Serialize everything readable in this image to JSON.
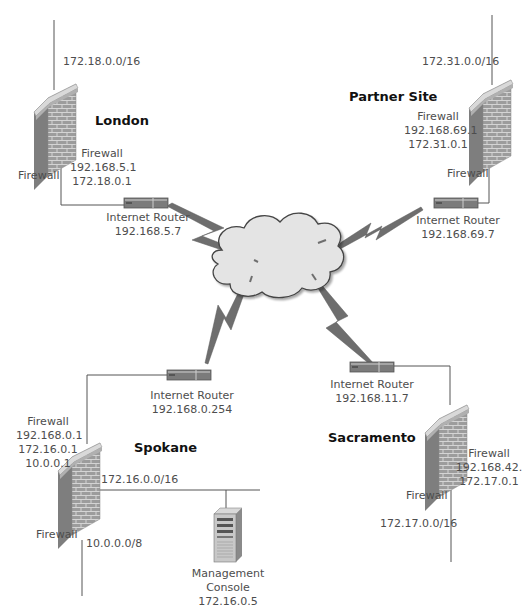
{
  "diagram": {
    "sites": {
      "london": {
        "name": "London",
        "network": "172.18.0.0/16",
        "firewall_label": "Firewall",
        "firewall_info": [
          "Firewall",
          "192.168.5.1",
          "172.18.0.1"
        ],
        "router": {
          "label": "Internet Router",
          "ip": "192.168.5.7"
        }
      },
      "partner": {
        "name": "Partner Site",
        "network": "172.31.0.0/16",
        "firewall_label": "Firewall",
        "firewall_info": [
          "Firewall",
          "192.168.69.1",
          "172.31.0.1"
        ],
        "router": {
          "label": "Internet Router",
          "ip": "192.168.69.7"
        }
      },
      "spokane": {
        "name": "Spokane",
        "network_internal": "172.16.0.0/16",
        "network_secondary": "10.0.0.0/8",
        "firewall_label": "Firewall",
        "firewall_info": [
          "Firewall",
          "192.168.0.1",
          "172.16.0.1",
          "10.0.0.1"
        ],
        "router": {
          "label": "Internet Router",
          "ip": "192.168.0.254"
        },
        "server": {
          "label_line1": "Management",
          "label_line2": "Console",
          "ip": "172.16.0.5"
        }
      },
      "sacramento": {
        "name": "Sacramento",
        "network": "172.17.0.0/16",
        "firewall_label": "Firewall",
        "firewall_info": [
          "Firewall",
          "192.168.42.",
          "172.17.0.1"
        ],
        "router": {
          "label": "Internet Router",
          "ip": "192.168.11.7"
        }
      }
    },
    "colors": {
      "line": "#555555",
      "cloud_fill": "#e6e6e6",
      "bolt": "#6e6e6e",
      "router": "#7a7a7a",
      "brick": "#9a9a9a"
    }
  }
}
